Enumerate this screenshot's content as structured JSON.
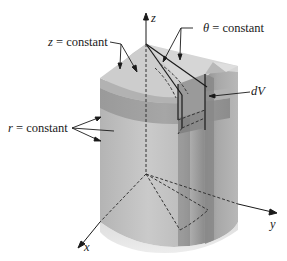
{
  "figure": {
    "labels": {
      "z_constant": {
        "var": "z",
        "text": " = constant"
      },
      "theta_constant": {
        "var": "θ",
        "text": " = constant"
      },
      "r_constant": {
        "var": "r",
        "text": " = constant"
      },
      "dV": "dV"
    },
    "axes": {
      "x": "x",
      "y": "y",
      "z": "z"
    },
    "colors": {
      "top_surface": "#cfcfcf",
      "upper_band": "#9d9d9d",
      "side_light": "#c4c4c4",
      "side_dark": "#8f8f8f",
      "lines": "#1a1a1a",
      "dashes": "#333333"
    }
  }
}
